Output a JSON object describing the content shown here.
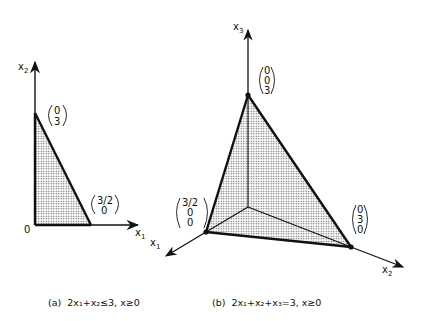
{
  "figure_a": {
    "axis_x_label": "x",
    "axis_x_sub": "1",
    "axis_y_label": "x",
    "axis_y_sub": "2",
    "origin_label": "0",
    "vertex_top": [
      "0",
      "3"
    ],
    "vertex_right": [
      "3/2",
      "0"
    ],
    "caption": {
      "tag": "(a)",
      "text": "2x₁+x₂≤3,  x≥0"
    }
  },
  "figure_b": {
    "axis_x1_label": "x",
    "axis_x1_sub": "1",
    "axis_x2_label": "x",
    "axis_x2_sub": "2",
    "axis_x3_label": "x",
    "axis_x3_sub": "3",
    "vertex_top": [
      "0",
      "0",
      "3"
    ],
    "vertex_left": [
      "3/2",
      "0",
      "0"
    ],
    "vertex_right": [
      "0",
      "3",
      "0"
    ],
    "caption": {
      "tag": "(b)",
      "text": "2x₁+x₂+x₃=3,  x≥0"
    }
  },
  "colors": {
    "line": "#111111",
    "fill_dots": "#555555",
    "background": "#ffffff"
  }
}
